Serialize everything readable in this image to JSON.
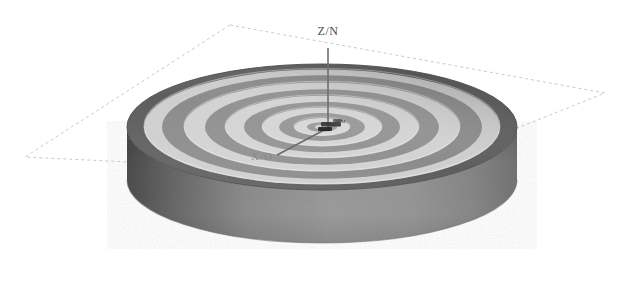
{
  "figure": {
    "title": "",
    "type": "3d-cylinder-fringe-pattern",
    "background_color": "#ffffff"
  },
  "axes": {
    "vertical": {
      "label": "Z/N",
      "name": "z-axis",
      "color": "#6b6b6b"
    },
    "horizontal_left": {
      "label": "X/O",
      "name": "x-axis",
      "color": "#8a8a8a"
    },
    "center_annotation": {
      "label": "Y/M",
      "name": "y-axis",
      "color": "#333333"
    }
  },
  "reference_plane": {
    "name": "dashed-reference-plane",
    "stroke_color": "#c8c8c8",
    "dash_pattern": "3 3",
    "corners": [
      {
        "x": 230,
        "y": 25
      },
      {
        "x": 605,
        "y": 93
      },
      {
        "x": 400,
        "y": 175
      },
      {
        "x": 25,
        "y": 157
      }
    ]
  },
  "cylinder": {
    "name": "cylinder-body",
    "top_face": {
      "center_x": 322,
      "center_y": 127,
      "radius_x": 195,
      "radius_y": 63,
      "base_color": "#b0b0b0"
    },
    "side_wall": {
      "height": 95,
      "light_color": "#a9a9a9",
      "dark_color": "#5e5e5e"
    },
    "rim_color": "#4f4f4f"
  },
  "fringe_pattern": {
    "name": "concentric-rings",
    "description": "alternating light and dark concentric elliptical bands",
    "ring_count": 11,
    "light_color": "#d8d8d8",
    "dark_color": "#909090",
    "outer_dark_color": "#5a5a5a",
    "ring_radii": [
      0.06,
      0.14,
      0.22,
      0.31,
      0.4,
      0.5,
      0.6,
      0.71,
      0.82,
      0.91,
      1.0
    ]
  },
  "colors": {
    "stroke_light": "#c8c8c8",
    "axis": "#6b6b6b",
    "text": "#4a4a4a"
  }
}
